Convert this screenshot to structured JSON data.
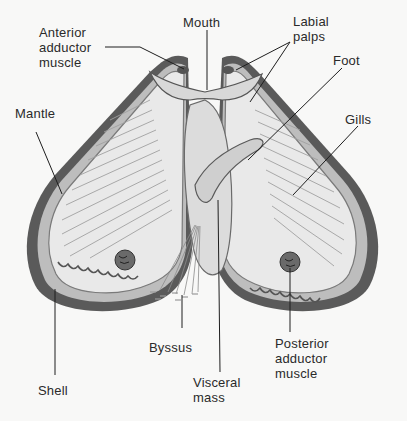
{
  "diagram": {
    "labels": {
      "anterior_adductor": "Anterior\nadductor\nmuscle",
      "mouth": "Mouth",
      "labial_palps": "Labial\npalps",
      "foot": "Foot",
      "mantle": "Mantle",
      "gills": "Gills",
      "byssus": "Byssus",
      "shell": "Shell",
      "visceral_mass": "Visceral\nmass",
      "posterior_adductor": "Posterior\nadductor\nmuscle"
    },
    "colors": {
      "background": "#f8f8f7",
      "shell_dark": "#3a3a3a",
      "shell_mid": "#8a8a8a",
      "interior": "#ececec",
      "line": "#1e1e1e",
      "text": "#2a2a2a"
    }
  }
}
